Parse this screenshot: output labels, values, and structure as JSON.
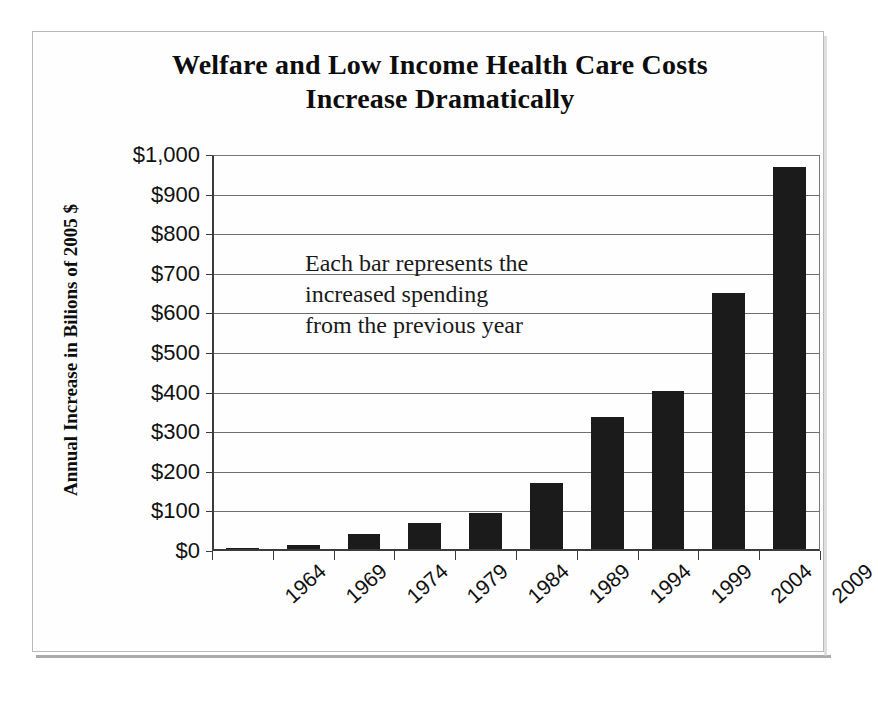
{
  "chart_data": {
    "type": "bar",
    "title": "Welfare and Low Income Health Care Costs Increase Dramatically",
    "title_line1": "Welfare and Low Income Health Care Costs",
    "title_line2": "Increase Dramatically",
    "xlabel": "",
    "ylabel": "Annual Increase in Bilions of 2005 $",
    "categories": [
      "1964",
      "1969",
      "1974",
      "1979",
      "1984",
      "1989",
      "1994",
      "1999",
      "2004",
      "2009"
    ],
    "values": [
      8,
      16,
      42,
      70,
      95,
      172,
      338,
      403,
      652,
      970
    ],
    "ylim": [
      0,
      1000
    ],
    "ytick_values": [
      0,
      100,
      200,
      300,
      400,
      500,
      600,
      700,
      800,
      900,
      1000
    ],
    "ytick_labels": [
      "$0",
      "$100",
      "$200",
      "$300",
      "$400",
      "$500",
      "$600",
      "$700",
      "$800",
      "$900",
      "$1,000"
    ],
    "grid": true,
    "legend": "none",
    "annotations": [
      {
        "name": "each-bar-note",
        "text": "Each bar represents the increased spending from the previous year"
      }
    ],
    "bar_color": "#1b1b1b",
    "gridline_color": "#6e6e6e",
    "axis_color": "#3b3b3b",
    "background_color": "#ffffff"
  }
}
